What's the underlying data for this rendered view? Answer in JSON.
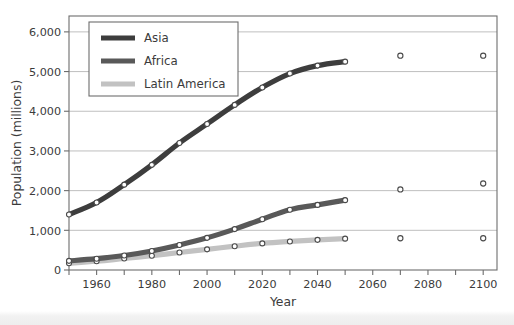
{
  "chart_data": {
    "type": "line",
    "title": "",
    "xlabel": "Year",
    "ylabel": "Population (millions)",
    "xlim": [
      1950,
      2105
    ],
    "ylim": [
      0,
      6400
    ],
    "ytick_values": [
      0,
      1000,
      2000,
      3000,
      4000,
      5000,
      6000
    ],
    "ytick_labels": [
      "0",
      "1,000",
      "2,000",
      "3,000",
      "4,000",
      "5,000",
      "6,000"
    ],
    "xtick_values": [
      1950,
      1960,
      1970,
      1980,
      1990,
      2000,
      2010,
      2020,
      2030,
      2040,
      2050,
      2060,
      2070,
      2080,
      2090,
      2100
    ],
    "xtick_labels": [
      "",
      "1960",
      "",
      "1980",
      "",
      "2000",
      "",
      "2020",
      "",
      "2040",
      "",
      "2060",
      "",
      "2080",
      "",
      "2100"
    ],
    "grid": "horizontal",
    "legend_position": "top-left",
    "series": [
      {
        "name": "Asia",
        "color": "#3d3d3d",
        "x": [
          1950,
          1960,
          1970,
          1980,
          1990,
          2000,
          2010,
          2020,
          2030,
          2040,
          2050
        ],
        "values": [
          1400,
          1700,
          2150,
          2650,
          3200,
          3680,
          4160,
          4600,
          4950,
          5150,
          5250
        ],
        "extra_points": {
          "x": [
            2070,
            2100
          ],
          "values": [
            5400,
            5400
          ]
        }
      },
      {
        "name": "Africa",
        "color": "#595959",
        "x": [
          1950,
          1960,
          1970,
          1980,
          1990,
          2000,
          2010,
          2020,
          2030,
          2040,
          2050
        ],
        "values": [
          230,
          285,
          365,
          480,
          630,
          810,
          1030,
          1280,
          1520,
          1640,
          1760
        ],
        "extra_points": {
          "x": [
            2070,
            2100
          ],
          "values": [
            2030,
            2180
          ]
        }
      },
      {
        "name": "Latin America",
        "color": "#c2c2c2",
        "x": [
          1950,
          1960,
          1970,
          1980,
          1990,
          2000,
          2010,
          2020,
          2030,
          2040,
          2050
        ],
        "values": [
          170,
          220,
          290,
          360,
          440,
          520,
          600,
          670,
          720,
          760,
          790
        ],
        "extra_points": {
          "x": [
            2070,
            2100
          ],
          "values": [
            800,
            800
          ]
        }
      }
    ]
  },
  "axes": {
    "ylabel": "Population (millions)",
    "xlabel": "Year"
  },
  "legend": {
    "items": [
      {
        "label": "Asia",
        "color": "#3d3d3d"
      },
      {
        "label": "Africa",
        "color": "#595959"
      },
      {
        "label": "Latin America",
        "color": "#c2c2c2"
      }
    ]
  },
  "colors": {
    "grid": "#b8b8b8",
    "frame": "#6d6d6d",
    "text": "#3b3b3b",
    "marker_fill": "#ffffff",
    "marker_stroke": "#4a4a4a"
  }
}
